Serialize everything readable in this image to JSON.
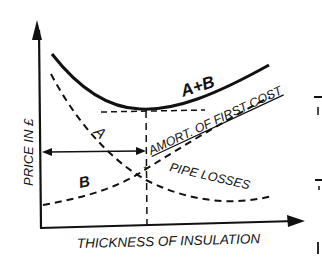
{
  "diagram": {
    "type": "cost-optimization-curves",
    "axes": {
      "x_label": "THICKNESS OF INSULATION",
      "y_label": "PRICE IN £"
    },
    "curves": [
      {
        "id": "A",
        "label": "A",
        "description": "PIPE LOSSES",
        "style": "dashed",
        "trend": "decreasing"
      },
      {
        "id": "B",
        "label": "B",
        "description": "AMORT. OF FIRST COST",
        "style": "dashed",
        "trend": "increasing"
      },
      {
        "id": "A+B",
        "label": "A+B",
        "description": "Total cost",
        "style": "solid",
        "trend": "U-shaped, minimum at optimum thickness"
      }
    ],
    "annotations": {
      "curve_a_label": "A",
      "curve_b_label": "B",
      "curve_total_label": "A+B",
      "amort_label": "AMORT. OF FIRST COST",
      "pipe_losses_label": "PIPE LOSSES"
    },
    "colors": {
      "ink": "#111111",
      "background": "#ffffff"
    }
  }
}
